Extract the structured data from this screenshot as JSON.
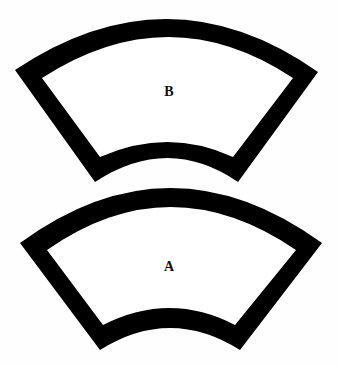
{
  "figure": {
    "type": "jastrow-illusion",
    "colors": {
      "band": "#000000",
      "fill": "#ffffff",
      "background": "#fefefe",
      "label": "#111111"
    },
    "shapes": [
      {
        "id": "B",
        "label": "B",
        "position": "top",
        "outer_path": "M15,70 Q169,-33 318,72 L238,182 Q168,134 95,182 Z",
        "inner_path": "M42,78 Q169,-4 293,78 L233,157 Q168,127 100,157 Z",
        "label_x": 169,
        "label_y": 85
      },
      {
        "id": "A",
        "label": "A",
        "position": "bottom",
        "outer_path": "M20,243 Q170,133 322,243 L240,350 Q170,306 100,350 Z",
        "inner_path": "M47,250 Q170,164 296,250 L235,325 Q170,291 103,325 Z",
        "label_x": 169,
        "label_y": 260
      }
    ]
  }
}
